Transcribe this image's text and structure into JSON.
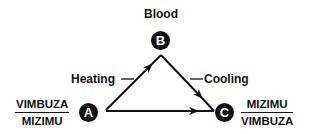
{
  "diagram": {
    "nodes": {
      "A": {
        "letter": "A",
        "numerator": "VIMBUZA",
        "denominator": "MIZIMU"
      },
      "B": {
        "letter": "B",
        "label": "Blood"
      },
      "C": {
        "letter": "C",
        "numerator": "MIZIMU",
        "denominator": "VIMBUZA"
      }
    },
    "edges": [
      {
        "from": "A",
        "to": "B",
        "label": "Heating"
      },
      {
        "from": "B",
        "to": "C",
        "label": "Cooling"
      },
      {
        "from": "A",
        "to": "C",
        "label": ""
      }
    ],
    "colors": {
      "ink": "#111111",
      "background": "#ffffff"
    }
  }
}
